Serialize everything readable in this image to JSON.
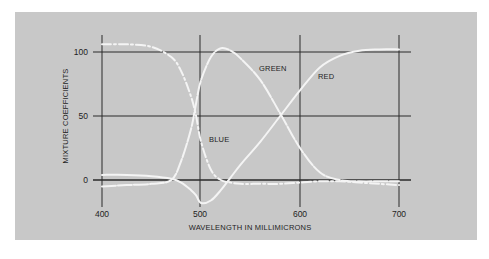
{
  "chart_data": {
    "type": "line",
    "title": "",
    "xlabel": "WAVELENGTH IN MILLIMICRONS",
    "ylabel": "MIXTURE COEFFICIENTS",
    "xlim": [
      400,
      700
    ],
    "ylim": [
      0,
      100
    ],
    "x_ticks": [
      "400",
      "500",
      "600",
      "700"
    ],
    "y_ticks": [
      "0",
      "50",
      "100"
    ],
    "grid": true,
    "legend_position": "inline-annotations",
    "annotations": [
      "BLUE",
      "GREEN",
      "RED"
    ],
    "x": [
      400,
      425,
      450,
      470,
      480,
      490,
      495,
      500,
      510,
      520,
      530,
      540,
      560,
      580,
      600,
      620,
      640,
      660,
      680,
      700
    ],
    "series": [
      {
        "name": "BLUE",
        "style": "dash-dot",
        "values": [
          106,
          106,
          104,
          96,
          85,
          65,
          50,
          30,
          8,
          0,
          -2,
          -3,
          -3,
          -3,
          -2,
          -1,
          -1,
          -2,
          -3,
          -4
        ]
      },
      {
        "name": "GREEN",
        "style": "dashed-solid",
        "values": [
          -5,
          -4,
          -3,
          0,
          15,
          40,
          60,
          78,
          96,
          103,
          101,
          95,
          78,
          52,
          25,
          6,
          0,
          -1,
          -1,
          -1
        ]
      },
      {
        "name": "RED",
        "style": "solid",
        "values": [
          4,
          4,
          3,
          1,
          -2,
          -8,
          -12,
          -18,
          -16,
          -8,
          2,
          12,
          30,
          50,
          70,
          88,
          97,
          101,
          102,
          102
        ]
      }
    ]
  },
  "labels": {
    "ylabel": "MIXTURE COEFFICIENTS",
    "xlabel": "WAVELENGTH IN MILLIMICRONS",
    "blue": "BLUE",
    "green": "GREEN",
    "red": "RED",
    "x400": "400",
    "x500": "500",
    "x600": "600",
    "x700": "700",
    "y0": "0",
    "y50": "50",
    "y100": "100"
  },
  "colors": {
    "panel_bg": "#c8c8c8",
    "gridline": "#2a2a2a",
    "curve": "#f4f4f4"
  }
}
